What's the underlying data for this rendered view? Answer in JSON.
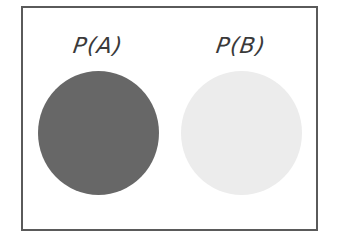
{
  "diagram": {
    "type": "two-set probability illustration",
    "sets": [
      {
        "label": "P(A)",
        "fill_color": "#676767",
        "shading": "dark"
      },
      {
        "label": "P(B)",
        "fill_color": "#ececec",
        "shading": "light"
      }
    ],
    "frame_border_color": "#5a5a5a",
    "background_color": "#ffffff"
  }
}
